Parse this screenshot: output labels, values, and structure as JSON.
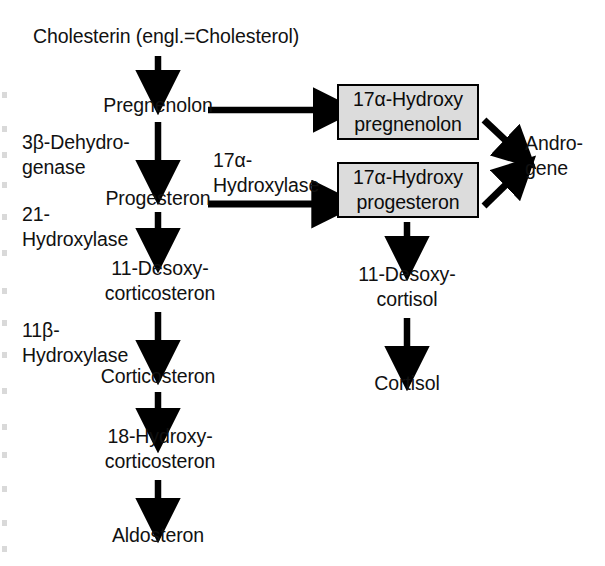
{
  "diagram": {
    "title": "Cholesterin (engl.=Cholesterol)",
    "type": "steroidogenesis-pathway",
    "colors": {
      "box_fill": "#dcdcdc",
      "box_border": "#000000",
      "text": "#111111",
      "background": "#ffffff"
    },
    "nodes": [
      {
        "id": "cholesterin",
        "label": "Cholesterin (engl.=Cholesterol)",
        "style": "plain"
      },
      {
        "id": "pregnenolon",
        "label": "Pregnenolon",
        "style": "plain"
      },
      {
        "id": "progesteron",
        "label": "Progesteron",
        "style": "plain"
      },
      {
        "id": "desoxycorticosteron",
        "label": "11-Desoxy-\ncorticosteron",
        "style": "plain"
      },
      {
        "id": "corticosteron",
        "label": "Corticosteron",
        "style": "plain"
      },
      {
        "id": "hydroxycorticosteron",
        "label": "18-Hydroxy-\ncorticosteron",
        "style": "plain"
      },
      {
        "id": "aldosteron",
        "label": "Aldosteron",
        "style": "plain"
      },
      {
        "id": "hydroxypregnenolon",
        "label_line1": "17α-Hydroxy",
        "label_line2": "pregnenolon",
        "style": "boxed"
      },
      {
        "id": "hydroxyprogesteron",
        "label_line1": "17α-Hydroxy",
        "label_line2": "progesteron",
        "style": "boxed"
      },
      {
        "id": "androgene",
        "label": "Andro-\ngene",
        "style": "plain"
      },
      {
        "id": "desoxycortisol",
        "label": "11-Desoxy-\ncortisol",
        "style": "plain"
      },
      {
        "id": "cortisol",
        "label": "Cortisol",
        "style": "plain"
      }
    ],
    "enzymes": [
      {
        "id": "dehydrogenase",
        "label": "3β-Dehydro-\ngenase",
        "reaction": "pregnenolon → progesteron"
      },
      {
        "id": "hydroxylase21",
        "label": "21-\nHydroxylase",
        "reaction": "progesteron → 11-Desoxycorticosteron"
      },
      {
        "id": "hydroxylase11b",
        "label": "11β-\nHydroxylase",
        "reaction": "11-Desoxycorticosteron → Corticosteron"
      },
      {
        "id": "hydroxylase17a",
        "label": "17α-\nHydroxylase",
        "reaction": "progesteron → 17α-Hydroxyprogesteron"
      }
    ],
    "edges": [
      {
        "from": "cholesterin",
        "to": "pregnenolon",
        "direction": "down"
      },
      {
        "from": "pregnenolon",
        "to": "progesteron",
        "direction": "down",
        "enzyme": "dehydrogenase"
      },
      {
        "from": "progesteron",
        "to": "desoxycorticosteron",
        "direction": "down",
        "enzyme": "hydroxylase21"
      },
      {
        "from": "desoxycorticosteron",
        "to": "corticosteron",
        "direction": "down",
        "enzyme": "hydroxylase11b"
      },
      {
        "from": "corticosteron",
        "to": "hydroxycorticosteron",
        "direction": "down"
      },
      {
        "from": "hydroxycorticosteron",
        "to": "aldosteron",
        "direction": "down"
      },
      {
        "from": "pregnenolon",
        "to": "hydroxypregnenolon",
        "direction": "right"
      },
      {
        "from": "progesteron",
        "to": "hydroxyprogesteron",
        "direction": "right",
        "enzyme": "hydroxylase17a"
      },
      {
        "from": "hydroxypregnenolon",
        "to": "androgene",
        "direction": "diagonal-down-right"
      },
      {
        "from": "hydroxyprogesteron",
        "to": "androgene",
        "direction": "diagonal-up-right"
      },
      {
        "from": "hydroxyprogesteron",
        "to": "desoxycortisol",
        "direction": "down"
      },
      {
        "from": "desoxycortisol",
        "to": "cortisol",
        "direction": "down"
      }
    ]
  }
}
